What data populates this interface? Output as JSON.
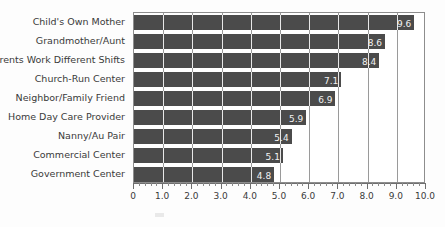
{
  "chart_data": {
    "type": "bar",
    "orientation": "horizontal",
    "title": "",
    "xlabel": "",
    "ylabel": "",
    "xlim": [
      0,
      10
    ],
    "xtick_step": 1.0,
    "minor_ticks_per_interval": 5,
    "grid": true,
    "legend": null,
    "bar_color": "#4b4b4b",
    "value_label_color": "#f2f2f2",
    "categories": [
      "Child's Own Mother",
      "Grandmother/Aunt",
      "Parents Work Different Shifts",
      "Church-Run Center",
      "Neighbor/Family Friend",
      "Home Day Care Provider",
      "Nanny/Au Pair",
      "Commercial Center",
      "Government Center"
    ],
    "values": [
      9.6,
      8.6,
      8.4,
      7.1,
      6.9,
      5.9,
      5.4,
      5.1,
      4.8
    ],
    "value_labels": [
      "9.6",
      "8.6",
      "8.4",
      "7.1",
      "6.9",
      "5.9",
      "5.4",
      "5.1",
      "4.8"
    ],
    "xticklabels": [
      "0",
      "1.0",
      "2.0",
      "3.0",
      "4.0",
      "5.0",
      "6.0",
      "7.0",
      "8.0",
      "9.0",
      "10.0"
    ],
    "xtickvalues": [
      0,
      1,
      2,
      3,
      4,
      5,
      6,
      7,
      8,
      9,
      10
    ]
  }
}
